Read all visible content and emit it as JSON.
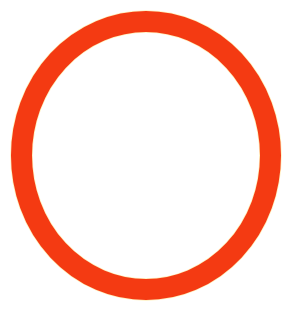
{
  "image": {
    "subject": "red-orange ring",
    "shape": "ellipse-ring",
    "background_color": "#ffffff",
    "ring_color": "#f43a12",
    "halo_color": "#ffd23a",
    "center": [
      146,
      155.5
    ],
    "radius_x": 124.5,
    "radius_y": 134,
    "stroke_width": 21
  }
}
